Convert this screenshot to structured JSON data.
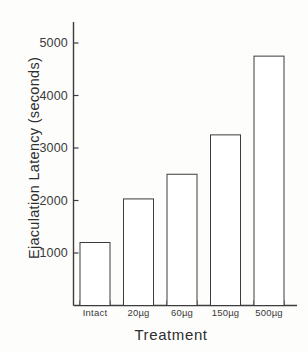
{
  "chart_data": {
    "type": "bar",
    "title": "",
    "xlabel": "Treatment",
    "ylabel": "Ejaculation Latency (seconds)",
    "categories": [
      "Intact",
      "20µg",
      "60µg",
      "150µg",
      "500µg"
    ],
    "values": [
      1200,
      2030,
      2500,
      3250,
      4750
    ],
    "yticks": [
      1000,
      2000,
      3000,
      4000,
      5000
    ],
    "ytick_labels": [
      "1000",
      "2000",
      "3000",
      "4000",
      "5000"
    ],
    "ylim": [
      0,
      5400
    ],
    "grid": false,
    "legend": null,
    "bar_style": {
      "fill": "#ffffff",
      "edge": "#3c3c3c",
      "edge_width": 1
    },
    "axis_color": "#3c3c3c",
    "background": "#fdfdfc"
  }
}
